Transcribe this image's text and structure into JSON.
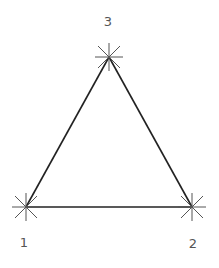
{
  "diagram": {
    "type": "triangle",
    "line_color": "#222222",
    "marker_color": "#555555",
    "nodes": [
      {
        "id": "1",
        "label": "1",
        "x": 26,
        "y": 207,
        "label_x": 24,
        "label_y": 242
      },
      {
        "id": "2",
        "label": "2",
        "x": 192,
        "y": 207,
        "label_x": 193,
        "label_y": 243
      },
      {
        "id": "3",
        "label": "3",
        "x": 109,
        "y": 57,
        "label_x": 108,
        "label_y": 21
      }
    ],
    "edges": [
      {
        "from": "1",
        "to": "2"
      },
      {
        "from": "2",
        "to": "3"
      },
      {
        "from": "3",
        "to": "1"
      }
    ]
  }
}
